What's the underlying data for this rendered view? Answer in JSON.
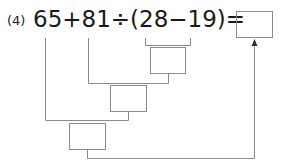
{
  "problem": {
    "number_label": "(4)",
    "expression": "65+81÷(28−19)=",
    "tokens": [
      "65",
      "+",
      "81",
      "÷",
      "(",
      "28",
      "−",
      "19",
      ")",
      "="
    ]
  },
  "diagram": {
    "answer_boxes": [
      "",
      "",
      "",
      ""
    ],
    "line_color": "#8a8a8a",
    "box_color": "#8a8a8a",
    "arrow_target": "final-answer-box"
  }
}
